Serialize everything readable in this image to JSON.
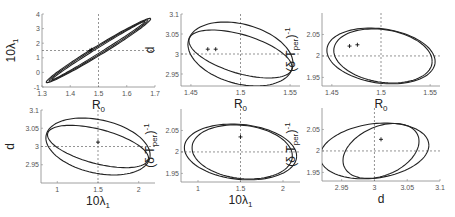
{
  "chart_data": [
    {
      "type": "line",
      "panel": "top-left",
      "xlabel": "R_0",
      "ylabel": "10λ_1",
      "xlim": [
        1.3,
        1.7
      ],
      "ylim": [
        -1,
        4
      ],
      "xticks": [
        "1.3",
        "1.4",
        "1.5",
        "1.6",
        "1.7"
      ],
      "xtick_values": [
        1.3,
        1.4,
        1.5,
        1.6,
        1.7
      ],
      "yticks": [
        "-1",
        "0",
        "1",
        "2",
        "3",
        "4"
      ],
      "ytick_values": [
        -1,
        0,
        1,
        2,
        3,
        4
      ],
      "crosshair": {
        "x": 1.5,
        "y": 1.5
      },
      "markers": [
        {
          "x": 1.47,
          "y": 1.5
        },
        {
          "x": 1.475,
          "y": 1.55
        }
      ],
      "series": [
        {
          "name": "ellipse-outer",
          "cx": 1.5,
          "cy": 1.5,
          "rx": 0.185,
          "ry": 2.2,
          "tilt": "positive-correlation",
          "corr": 0.985
        },
        {
          "name": "ellipse-middle",
          "cx": 1.5,
          "cy": 1.5,
          "rx": 0.175,
          "ry": 2.1,
          "corr": 0.99
        },
        {
          "name": "ellipse-inner",
          "cx": 1.5,
          "cy": 1.5,
          "rx": 0.165,
          "ry": 2.0,
          "corr": 0.995
        }
      ],
      "pixel_box": [
        42,
        14,
        155,
        87
      ]
    },
    {
      "type": "line",
      "panel": "top-middle",
      "xlabel": "R_0",
      "ylabel": "d",
      "xlim": [
        1.44,
        1.56
      ],
      "ylim": [
        2.92,
        3.1
      ],
      "xticks": [
        "1.45",
        "1.5",
        "1.55"
      ],
      "xtick_values": [
        1.45,
        1.5,
        1.55
      ],
      "yticks": [
        "2.95",
        "3",
        "3.05",
        "3.1"
      ],
      "ytick_values": [
        2.95,
        3.0,
        3.05,
        3.1
      ],
      "crosshair": {
        "x": 1.5,
        "y": 3.0
      },
      "markers": [
        {
          "x": 1.467,
          "y": 3.012
        },
        {
          "x": 1.475,
          "y": 3.012
        }
      ],
      "series": [
        {
          "name": "ellipse-outer",
          "cx": 1.5,
          "cy": 3.0,
          "rx": 0.053,
          "ry": 0.08,
          "corr": -0.3
        },
        {
          "name": "ellipse-inner",
          "cx": 1.5,
          "cy": 3.0,
          "rx": 0.052,
          "ry": 0.06,
          "corr": -0.55
        }
      ],
      "pixel_box": [
        181,
        14,
        300,
        86
      ]
    },
    {
      "type": "line",
      "panel": "top-right",
      "xlabel": "R_0",
      "ylabel": "(δ T_per)^-1",
      "xlim": [
        1.44,
        1.56
      ],
      "ylim": [
        1.93,
        2.1
      ],
      "xticks": [
        "1.45",
        "1.5",
        "1.55"
      ],
      "xtick_values": [
        1.45,
        1.5,
        1.55
      ],
      "yticks": [
        "1.95",
        "2",
        "2.05"
      ],
      "ytick_values": [
        1.95,
        2.0,
        2.05
      ],
      "crosshair": {
        "x": 1.5,
        "y": 2.0
      },
      "markers": [
        {
          "x": 1.468,
          "y": 2.023
        },
        {
          "x": 1.476,
          "y": 2.026
        }
      ],
      "series": [
        {
          "name": "ellipse-outer",
          "cx": 1.5,
          "cy": 2.0,
          "rx": 0.055,
          "ry": 0.065,
          "corr": -0.2
        },
        {
          "name": "ellipse-inner",
          "cx": 1.502,
          "cy": 2.0,
          "rx": 0.05,
          "ry": 0.063,
          "corr": -0.2
        }
      ],
      "pixel_box": [
        322,
        13,
        440,
        86
      ]
    },
    {
      "type": "line",
      "panel": "bottom-left",
      "xlabel": "10λ_1",
      "ylabel": "d",
      "xlim": [
        0.8,
        2.2
      ],
      "ylim": [
        2.9,
        3.1
      ],
      "xticks": [
        "1",
        "1.5",
        "2"
      ],
      "xtick_values": [
        1.0,
        1.5,
        2.0
      ],
      "yticks": [
        "2.95",
        "3",
        "3.05",
        "3.1"
      ],
      "ytick_values": [
        2.95,
        3.0,
        3.05,
        3.1
      ],
      "crosshair": {
        "x": 1.5,
        "y": 3.0
      },
      "markers": [
        {
          "x": 1.5,
          "y": 3.012
        }
      ],
      "series": [
        {
          "name": "ellipse-outer",
          "cx": 1.5,
          "cy": 3.0,
          "rx": 0.64,
          "ry": 0.078,
          "corr": -0.3
        },
        {
          "name": "ellipse-inner",
          "cx": 1.5,
          "cy": 3.0,
          "rx": 0.62,
          "ry": 0.058,
          "corr": -0.55
        }
      ],
      "pixel_box": [
        41,
        110,
        155,
        183
      ]
    },
    {
      "type": "line",
      "panel": "bottom-middle",
      "xlabel": "10λ_1",
      "ylabel": "(δ T_per)^-1",
      "xlim": [
        0.8,
        2.2
      ],
      "ylim": [
        1.93,
        2.1
      ],
      "xticks": [
        "1",
        "1.5",
        "2"
      ],
      "xtick_values": [
        1.0,
        1.5,
        2.0
      ],
      "yticks": [
        "1.95",
        "2",
        "2.05"
      ],
      "ytick_values": [
        1.95,
        2.0,
        2.05
      ],
      "crosshair": {
        "x": 1.5,
        "y": 2.0
      },
      "markers": [
        {
          "x": 1.5,
          "y": 2.035
        }
      ],
      "series": [
        {
          "name": "ellipse-outer",
          "cx": 1.5,
          "cy": 2.0,
          "rx": 0.66,
          "ry": 0.065,
          "corr": -0.15
        },
        {
          "name": "ellipse-inner",
          "cx": 1.52,
          "cy": 2.0,
          "rx": 0.59,
          "ry": 0.063,
          "corr": -0.15
        }
      ],
      "pixel_box": [
        181,
        109,
        300,
        182
      ]
    },
    {
      "type": "line",
      "panel": "bottom-right",
      "xlabel": "d",
      "ylabel": "(δ T_per)^-1",
      "xlim": [
        2.92,
        3.1
      ],
      "ylim": [
        1.93,
        2.1
      ],
      "xticks": [
        "2.95",
        "3",
        "3.05",
        "3.1"
      ],
      "xtick_values": [
        2.95,
        3.0,
        3.05,
        3.1
      ],
      "yticks": [
        "1.95",
        "2",
        "2.05"
      ],
      "ytick_values": [
        1.95,
        2.0,
        2.05
      ],
      "crosshair": {
        "x": 3.0,
        "y": 2.0
      },
      "markers": [
        {
          "x": 3.01,
          "y": 2.027
        }
      ],
      "series": [
        {
          "name": "ellipse-outer",
          "cx": 3.0,
          "cy": 2.0,
          "rx": 0.083,
          "ry": 0.065,
          "corr": 0.2
        },
        {
          "name": "ellipse-inner",
          "cx": 3.01,
          "cy": 2.0,
          "rx": 0.058,
          "ry": 0.064,
          "corr": 0.35
        }
      ],
      "pixel_box": [
        322,
        108,
        440,
        181
      ]
    }
  ]
}
